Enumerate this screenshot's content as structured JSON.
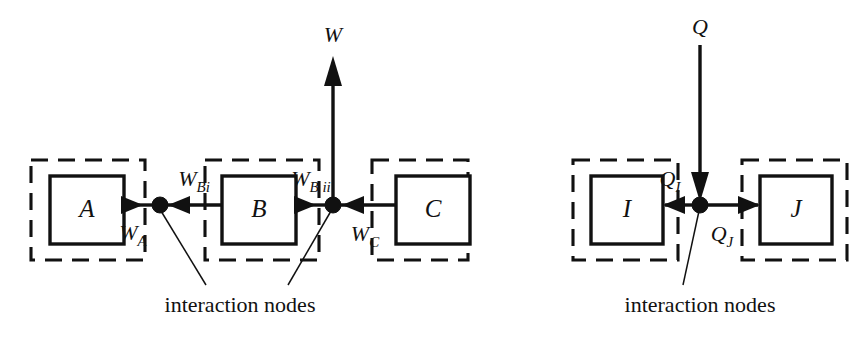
{
  "diagram": {
    "colors": {
      "ink": "#111111",
      "background": "#ffffff"
    },
    "panels": [
      {
        "id": "work-panel",
        "caption": "interaction nodes",
        "external_flow": {
          "label": "W",
          "direction": "up"
        },
        "blocks": [
          {
            "id": "A",
            "label": "A"
          },
          {
            "id": "B",
            "label": "B"
          },
          {
            "id": "C",
            "label": "C"
          }
        ],
        "nodes": [
          {
            "id": "node-1"
          },
          {
            "id": "node-2"
          }
        ],
        "flows": [
          {
            "id": "w-a",
            "base": "W",
            "sub": "A",
            "from": "A",
            "to": "node-1",
            "direction": "right"
          },
          {
            "id": "w-bi",
            "base": "W",
            "sub": "Bi",
            "from": "B",
            "to": "node-1",
            "direction": "left"
          },
          {
            "id": "w-bii",
            "base": "W",
            "sub": "B ii",
            "from": "B",
            "to": "node-2",
            "direction": "right"
          },
          {
            "id": "w-c",
            "base": "W",
            "sub": "C",
            "from": "C",
            "to": "node-2",
            "direction": "left"
          }
        ]
      },
      {
        "id": "heat-panel",
        "caption": "interaction nodes",
        "external_flow": {
          "label": "Q",
          "direction": "down"
        },
        "blocks": [
          {
            "id": "I",
            "label": "I"
          },
          {
            "id": "J",
            "label": "J"
          }
        ],
        "nodes": [
          {
            "id": "node-3"
          }
        ],
        "flows": [
          {
            "id": "q-i",
            "base": "Q",
            "sub": "I",
            "from": "node-3",
            "to": "I",
            "direction": "left"
          },
          {
            "id": "q-j",
            "base": "Q",
            "sub": "J",
            "from": "node-3",
            "to": "J",
            "direction": "right"
          }
        ]
      }
    ]
  }
}
